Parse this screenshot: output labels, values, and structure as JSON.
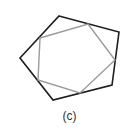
{
  "figure": {
    "caption": "(c)",
    "outer_polygon": {
      "shape": "pentagon",
      "points": "59,16 119,32 112,85 53,100 20,58",
      "stroke": "#1e1e1e",
      "stroke_width": 1.6
    },
    "inner_polygon": {
      "shape": "pentagon",
      "points": "40,38 88,24 115,60 80,93 38,80",
      "stroke": "#9a9a9a",
      "stroke_width": 1.4
    }
  }
}
